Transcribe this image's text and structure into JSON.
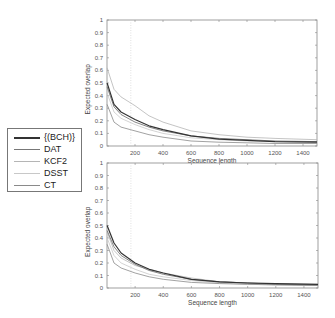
{
  "legend": {
    "items": [
      {
        "label": "{(BCH)}",
        "color": "#333333",
        "width": 1.2
      },
      {
        "label": "DAT",
        "color": "#777777",
        "width": 0.9
      },
      {
        "label": "KCF2",
        "color": "#b5b5b5",
        "width": 0.8
      },
      {
        "label": "DSST",
        "color": "#c8c8c8",
        "width": 0.8
      },
      {
        "label": "CT",
        "color": "#8a8a8a",
        "width": 0.8
      }
    ]
  },
  "chart_data": [
    {
      "type": "line",
      "title": "",
      "xlabel": "Sequence length",
      "ylabel": "Expected overlap",
      "xlim": [
        0,
        1500
      ],
      "ylim": [
        0,
        1
      ],
      "xticks": [
        200,
        400,
        600,
        800,
        1000,
        1200,
        1400
      ],
      "yticks": [
        0,
        0.1,
        0.2,
        0.3,
        0.4,
        0.5,
        0.6,
        0.7,
        0.8,
        0.9,
        1
      ],
      "grid": false,
      "vline_x": 170,
      "x": [
        1,
        50,
        100,
        200,
        300,
        400,
        600,
        800,
        1000,
        1200,
        1500
      ],
      "series": [
        {
          "name": "{(BCH)}",
          "values": [
            0.5,
            0.33,
            0.27,
            0.21,
            0.16,
            0.13,
            0.08,
            0.055,
            0.045,
            0.035,
            0.03
          ]
        },
        {
          "name": "DAT",
          "values": [
            0.47,
            0.31,
            0.25,
            0.19,
            0.15,
            0.12,
            0.08,
            0.06,
            0.05,
            0.04,
            0.035
          ]
        },
        {
          "name": "KCF2",
          "values": [
            0.62,
            0.45,
            0.39,
            0.32,
            0.24,
            0.19,
            0.12,
            0.09,
            0.07,
            0.06,
            0.05
          ]
        },
        {
          "name": "DSST",
          "values": [
            0.42,
            0.27,
            0.22,
            0.17,
            0.13,
            0.1,
            0.065,
            0.05,
            0.04,
            0.035,
            0.03
          ]
        },
        {
          "name": "CT",
          "values": [
            0.33,
            0.19,
            0.15,
            0.12,
            0.09,
            0.07,
            0.04,
            0.03,
            0.025,
            0.02,
            0.02
          ]
        }
      ]
    },
    {
      "type": "line",
      "title": "",
      "xlabel": "Sequence length",
      "ylabel": "Expected overlap",
      "xlim": [
        0,
        1500
      ],
      "ylim": [
        0,
        1
      ],
      "xticks": [
        200,
        400,
        600,
        800,
        1000,
        1200,
        1400
      ],
      "yticks": [
        0,
        0.1,
        0.2,
        0.3,
        0.4,
        0.5,
        0.6,
        0.7,
        0.8,
        0.9,
        1
      ],
      "grid": false,
      "vline_x": 170,
      "x": [
        1,
        50,
        100,
        200,
        300,
        400,
        600,
        800,
        1000,
        1200,
        1500
      ],
      "series": [
        {
          "name": "{(BCH)}",
          "values": [
            0.5,
            0.36,
            0.28,
            0.2,
            0.15,
            0.12,
            0.07,
            0.05,
            0.04,
            0.035,
            0.03
          ]
        },
        {
          "name": "DAT",
          "values": [
            0.46,
            0.33,
            0.26,
            0.19,
            0.14,
            0.11,
            0.07,
            0.05,
            0.04,
            0.03,
            0.025
          ]
        },
        {
          "name": "KCF2",
          "values": [
            0.45,
            0.3,
            0.24,
            0.18,
            0.15,
            0.12,
            0.08,
            0.05,
            0.04,
            0.035,
            0.03
          ]
        },
        {
          "name": "DSST",
          "values": [
            0.4,
            0.26,
            0.2,
            0.15,
            0.11,
            0.09,
            0.06,
            0.04,
            0.03,
            0.025,
            0.02
          ]
        },
        {
          "name": "CT",
          "values": [
            0.35,
            0.2,
            0.16,
            0.12,
            0.09,
            0.07,
            0.045,
            0.035,
            0.03,
            0.025,
            0.02
          ]
        }
      ]
    }
  ]
}
